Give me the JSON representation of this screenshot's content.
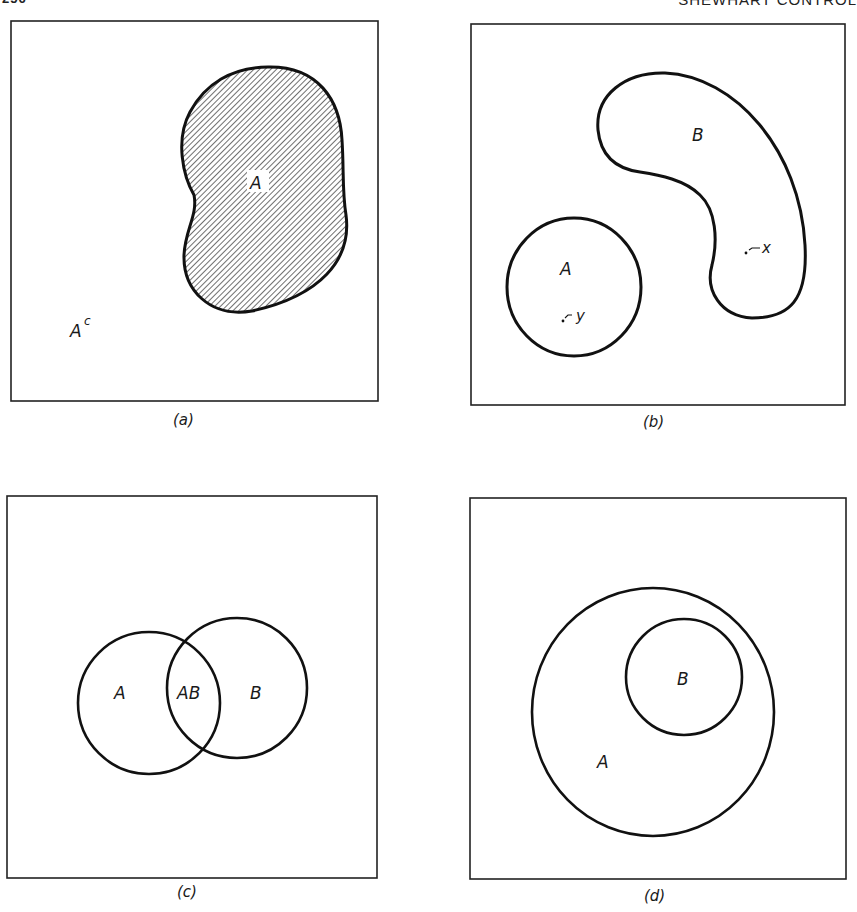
{
  "header": {
    "page_number": "256",
    "running_title": "SHEWHART CONTROL"
  },
  "panels": [
    {
      "id": "a",
      "caption": "(a)",
      "labels": {
        "set": "A",
        "complement_base": "A",
        "complement_sup": "c"
      },
      "description": "Set A shaded with diagonal hatching inside universal rectangle; complement A^c is the rest"
    },
    {
      "id": "b",
      "caption": "(b)",
      "labels": {
        "set_a": "A",
        "set_b": "B",
        "point_in_a": "y",
        "point_in_b": "x"
      },
      "description": "Disjoint sets A and B; point y in A, point x in B"
    },
    {
      "id": "c",
      "caption": "(c)",
      "labels": {
        "set_a": "A",
        "intersection": "AB",
        "set_b": "B"
      },
      "description": "Overlapping sets A and B with intersection AB"
    },
    {
      "id": "d",
      "caption": "(d)",
      "labels": {
        "outer": "A",
        "inner": "B"
      },
      "description": "B is a subset of A"
    }
  ],
  "colors": {
    "ink": "#111111",
    "paper": "#ffffff"
  }
}
